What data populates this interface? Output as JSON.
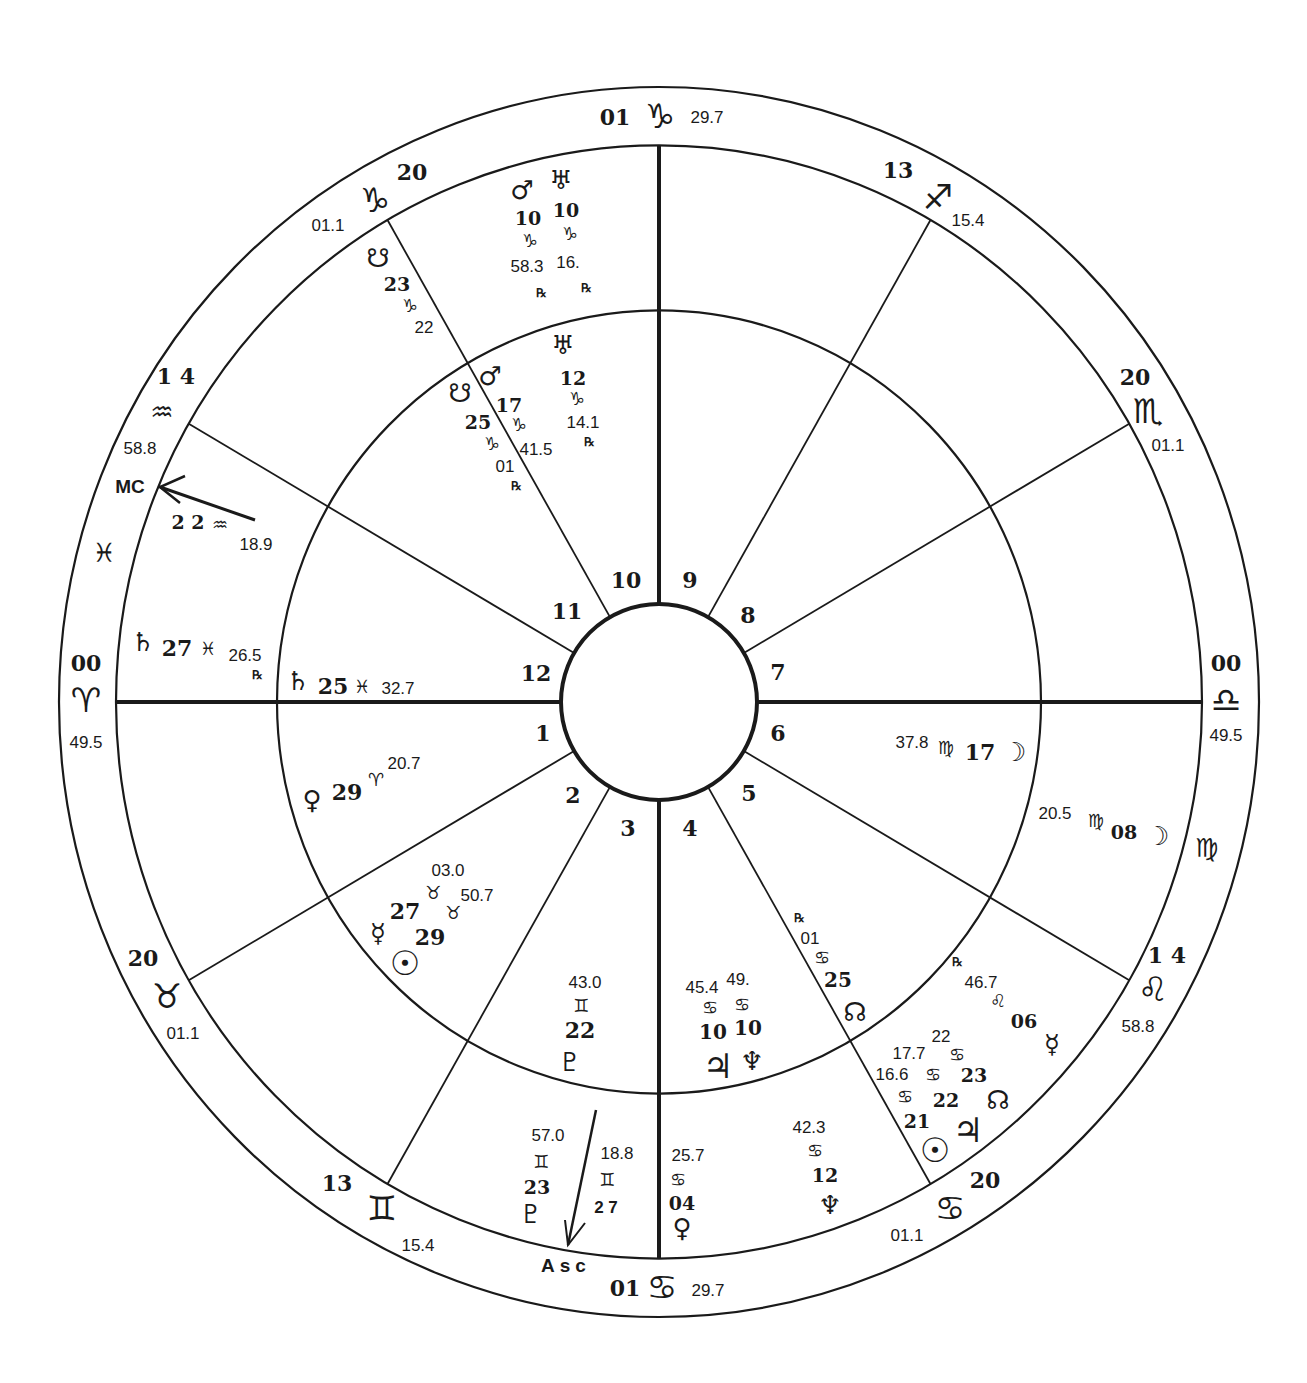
{
  "chart_type": "Bi-wheel natal astrology chart",
  "colors": {
    "ink": "#1a1a1a",
    "paper": "#ffffff"
  },
  "house_numbers": [
    "1",
    "2",
    "3",
    "4",
    "5",
    "6",
    "7",
    "8",
    "9",
    "10",
    "11",
    "12"
  ],
  "cusps": [
    {
      "id": "c10",
      "deg": "01",
      "sign": "♑",
      "sign_name": "capricorn",
      "min": "29.7"
    },
    {
      "id": "c11",
      "deg": "20",
      "sign": "♑",
      "sign_name": "capricorn",
      "min": "01.1"
    },
    {
      "id": "c12",
      "deg": "1 4",
      "sign": "♒",
      "sign_name": "aquarius",
      "min": "58.8"
    },
    {
      "id": "c1",
      "deg": "00",
      "sign": "♈",
      "sign_name": "aries",
      "min": "49.5"
    },
    {
      "id": "c2",
      "deg": "20",
      "sign": "♉",
      "sign_name": "taurus",
      "min": "01.1"
    },
    {
      "id": "c3",
      "deg": "13",
      "sign": "♊",
      "sign_name": "gemini",
      "min": "15.4"
    },
    {
      "id": "c4",
      "deg": "01",
      "sign": "♋",
      "sign_name": "cancer",
      "min": "29.7"
    },
    {
      "id": "c5",
      "deg": "20",
      "sign": "♋",
      "sign_name": "cancer",
      "min": "01.1"
    },
    {
      "id": "c6",
      "deg": "1 4",
      "sign": "♌",
      "sign_name": "leo",
      "min": "58.8"
    },
    {
      "id": "c7",
      "deg": "00",
      "sign": "♎",
      "sign_name": "libra",
      "min": "49.5"
    },
    {
      "id": "c8",
      "deg": "20",
      "sign": "♏",
      "sign_name": "scorpio",
      "min": "01.1"
    },
    {
      "id": "c9",
      "deg": "13",
      "sign": "♐",
      "sign_name": "sagittarius",
      "min": "15.4"
    }
  ],
  "intercepted_signs": [
    {
      "sign": "♓",
      "sign_name": "pisces"
    },
    {
      "sign": "♍",
      "sign_name": "virgo"
    }
  ],
  "angles": {
    "mc": {
      "label": "MC",
      "deg": "2 2",
      "sign": "♒",
      "min": "18.9"
    },
    "asc": {
      "label": "Asc",
      "deg": "2 7",
      "sign": "♊",
      "min": "18.8"
    }
  },
  "outer_planets": [
    {
      "name": "mars",
      "glyph": "♂",
      "deg": "10",
      "sign": "♑",
      "min": "58.3",
      "rx": "℞"
    },
    {
      "name": "uranus",
      "glyph": "♅",
      "deg": "10",
      "sign": "♑",
      "min": "16.",
      "rx": "℞"
    },
    {
      "name": "south-node",
      "glyph": "☋",
      "deg": "23",
      "sign": "♑",
      "min": "22"
    },
    {
      "name": "saturn",
      "glyph": "♄",
      "deg": "27",
      "sign": "♓",
      "min": "26.5",
      "rx": "℞"
    },
    {
      "name": "moon",
      "glyph": "☽",
      "deg": "08",
      "sign": "♍",
      "min": "20.5"
    },
    {
      "name": "mercury",
      "glyph": "☿",
      "deg": "06",
      "sign": "♌",
      "min": "46.7",
      "rx": "℞"
    },
    {
      "name": "north-node",
      "glyph": "☊",
      "deg": "23",
      "sign": "♋",
      "min": "22"
    },
    {
      "name": "jupiter",
      "glyph": "♃",
      "deg": "22",
      "sign": "♋",
      "min": "17.7"
    },
    {
      "name": "sun",
      "glyph": "☉",
      "deg": "21",
      "sign": "♋",
      "min": "16.6"
    },
    {
      "name": "neptune",
      "glyph": "♆",
      "deg": "12",
      "sign": "♋",
      "min": "42.3"
    },
    {
      "name": "venus",
      "glyph": "♀",
      "deg": "04",
      "sign": "♋",
      "min": "25.7"
    },
    {
      "name": "pluto",
      "glyph": "♇",
      "deg": "23",
      "sign": "♊",
      "min": "57.0"
    }
  ],
  "inner_planets": [
    {
      "name": "uranus",
      "glyph": "♅",
      "deg": "12",
      "sign": "♑",
      "min": "14.1",
      "rx": "℞"
    },
    {
      "name": "mars",
      "glyph": "♂",
      "deg": "17",
      "sign": "♑",
      "min": "41.5"
    },
    {
      "name": "south-node",
      "glyph": "☋",
      "deg": "25",
      "sign": "♑",
      "min": "01",
      "rx": "℞"
    },
    {
      "name": "saturn",
      "glyph": "♄",
      "deg": "25",
      "sign": "♓",
      "min": "32.7"
    },
    {
      "name": "venus",
      "glyph": "♀",
      "deg": "29",
      "sign": "♈",
      "min": "20.7"
    },
    {
      "name": "mercury",
      "glyph": "☿",
      "deg": "27",
      "sign": "♉",
      "min": "03.0"
    },
    {
      "name": "sun",
      "glyph": "☉",
      "deg": "29",
      "sign": "♉",
      "min": "50.7"
    },
    {
      "name": "pluto",
      "glyph": "♇",
      "deg": "22",
      "sign": "♊",
      "min": "43.0"
    },
    {
      "name": "jupiter",
      "glyph": "♃",
      "deg": "10",
      "sign": "♋",
      "min": "45.4"
    },
    {
      "name": "neptune",
      "glyph": "♆",
      "deg": "10",
      "sign": "♋",
      "min": "49."
    },
    {
      "name": "north-node",
      "glyph": "☊",
      "deg": "25",
      "sign": "♋",
      "min": "01",
      "rx": "℞"
    },
    {
      "name": "moon",
      "glyph": "☽",
      "deg": "17",
      "sign": "♍",
      "min": "37.8"
    }
  ]
}
